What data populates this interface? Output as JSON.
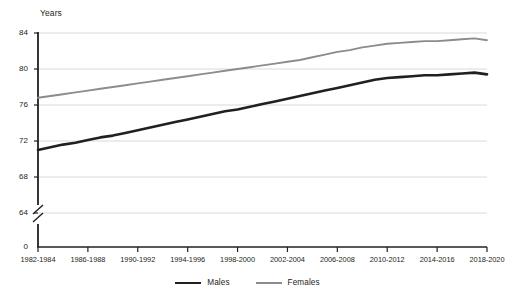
{
  "chart_data": {
    "type": "line",
    "title": "",
    "ylabel": "Years",
    "xlabel": "",
    "ylim": [
      64,
      84
    ],
    "yticks": [
      84,
      80,
      76,
      72,
      68,
      64,
      0
    ],
    "axis_break": true,
    "axis_break_between": [
      64,
      0
    ],
    "grid": true,
    "grid_axis": "y",
    "legend_position": "bottom",
    "categories": [
      "1982-1984",
      "1983-1985",
      "1984-1986",
      "1985-1987",
      "1986-1988",
      "1987-1989",
      "1988-1990",
      "1989-1991",
      "1990-1992",
      "1991-1993",
      "1992-1994",
      "1993-1995",
      "1994-1996",
      "1995-1997",
      "1996-1998",
      "1997-1999",
      "1998-2000",
      "1999-2001",
      "2000-2002",
      "2001-2003",
      "2002-2004",
      "2003-2005",
      "2004-2006",
      "2005-2007",
      "2006-2008",
      "2007-2009",
      "2008-2010",
      "2009-2011",
      "2010-2012",
      "2011-2013",
      "2012-2014",
      "2013-2015",
      "2014-2016",
      "2015-2017",
      "2016-2018",
      "2017-2019",
      "2018-2020"
    ],
    "xtick_labels": [
      "1982-1984",
      "1986-1988",
      "1990-1992",
      "1994-1996",
      "1998-2000",
      "2002-2004",
      "2006-2008",
      "2010-2012",
      "2014-2016",
      "2018-2020"
    ],
    "series": [
      {
        "name": "Males",
        "color": "#231f20",
        "values": [
          71.0,
          71.3,
          71.6,
          71.8,
          72.1,
          72.4,
          72.6,
          72.9,
          73.2,
          73.5,
          73.8,
          74.1,
          74.4,
          74.7,
          75.0,
          75.3,
          75.5,
          75.8,
          76.1,
          76.4,
          76.7,
          77.0,
          77.3,
          77.6,
          77.9,
          78.2,
          78.5,
          78.8,
          79.0,
          79.1,
          79.2,
          79.3,
          79.3,
          79.4,
          79.5,
          79.6,
          79.4
        ]
      },
      {
        "name": "Females",
        "color": "#8c8c8c",
        "values": [
          76.8,
          77.0,
          77.2,
          77.4,
          77.6,
          77.8,
          78.0,
          78.2,
          78.4,
          78.6,
          78.8,
          79.0,
          79.2,
          79.4,
          79.6,
          79.8,
          80.0,
          80.2,
          80.4,
          80.6,
          80.8,
          81.0,
          81.3,
          81.6,
          81.9,
          82.1,
          82.4,
          82.6,
          82.8,
          82.9,
          83.0,
          83.1,
          83.1,
          83.2,
          83.3,
          83.4,
          83.2
        ]
      }
    ]
  },
  "legend": {
    "items": [
      {
        "label": "Males"
      },
      {
        "label": "Females"
      }
    ]
  },
  "colors": {
    "males": "#231f20",
    "females": "#8c8c8c",
    "grid": "#d9d9dd",
    "axis": "#231f20"
  }
}
